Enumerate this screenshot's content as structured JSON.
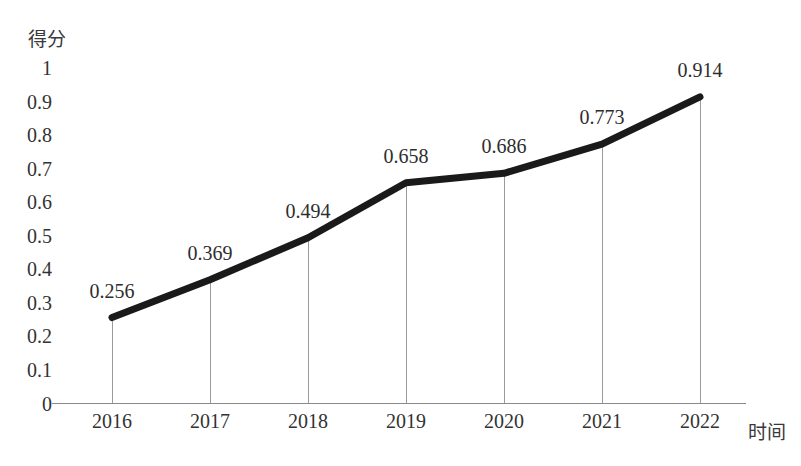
{
  "chart_data": {
    "type": "line",
    "title": "",
    "subtitle": "",
    "xlabel": "时间",
    "ylabel": "得分",
    "categories": [
      "2016",
      "2017",
      "2018",
      "2019",
      "2020",
      "2021",
      "2022"
    ],
    "values": [
      0.256,
      0.369,
      0.494,
      0.658,
      0.686,
      0.773,
      0.914
    ],
    "data_labels": [
      "0.256",
      "0.369",
      "0.494",
      "0.658",
      "0.686",
      "0.773",
      "0.914"
    ],
    "series": [
      {
        "name": "得分",
        "values": [
          0.256,
          0.369,
          0.494,
          0.658,
          0.686,
          0.773,
          0.914
        ]
      }
    ],
    "ylim": [
      0,
      1
    ],
    "xlim": [
      "2016",
      "2022"
    ],
    "y_ticks": [
      "0",
      "0.1",
      "0.2",
      "0.3",
      "0.4",
      "0.5",
      "0.6",
      "0.7",
      "0.8",
      "0.9",
      "1"
    ],
    "y_tick_values": [
      0,
      0.1,
      0.2,
      0.3,
      0.4,
      0.5,
      0.6,
      0.7,
      0.8,
      0.9,
      1
    ],
    "x_ticks": [
      "2016",
      "2017",
      "2018",
      "2019",
      "2020",
      "2021",
      "2022"
    ],
    "grid": false,
    "legend": false,
    "legend_position": "none",
    "markers": false,
    "drop_lines": true,
    "line_color": "#1a1a1a",
    "axis_color": "#8a8a8a",
    "dropline_color": "#9a9a9a",
    "text_color": "#333333",
    "background_color": "#ffffff",
    "line_width_px": 7,
    "annotations": []
  },
  "axis_titles": {
    "y": "得分",
    "x": "时间"
  }
}
